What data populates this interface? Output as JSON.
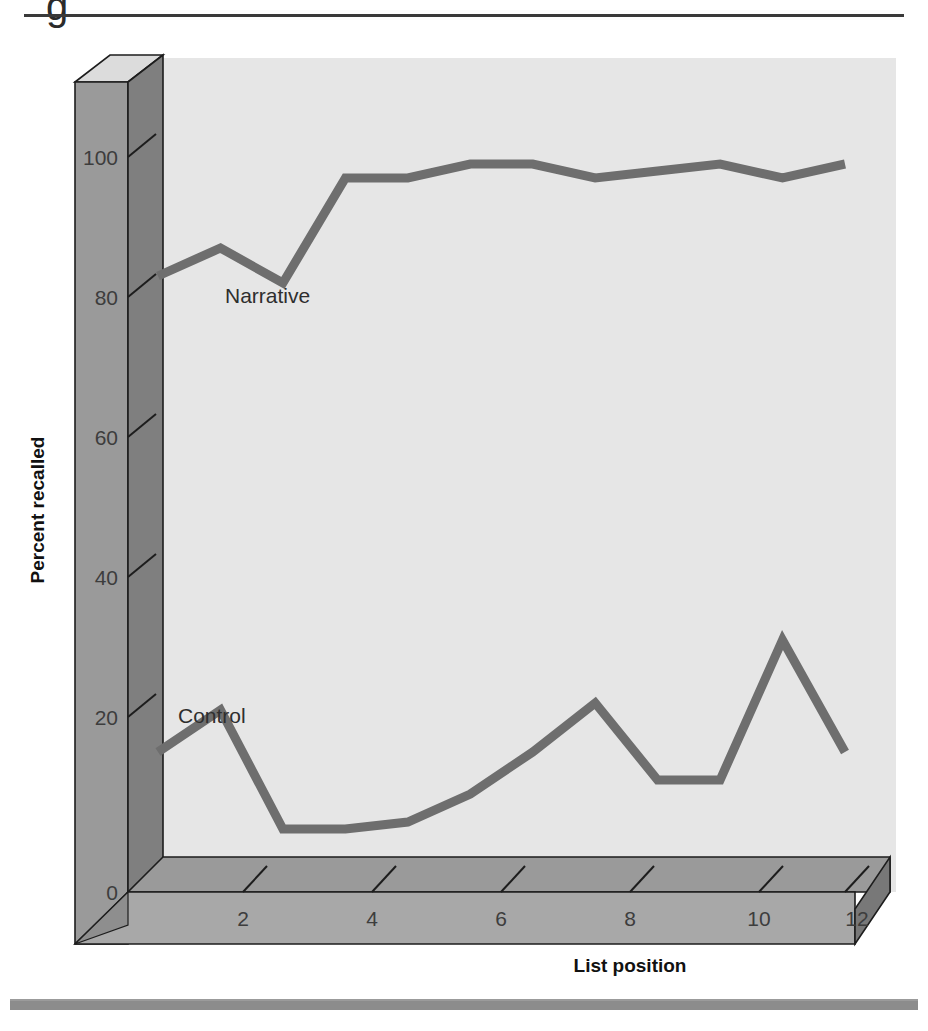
{
  "page": {
    "top_cropped_text": "g",
    "background_color": "#ffffff",
    "rule_color": "#8c8c8c"
  },
  "figure": {
    "plot_background_color": "#e6e6e6",
    "axis_block_face_color": "#8f8f8f",
    "axis_block_top_color": "#d8d8d8",
    "axis_block_side_color": "#7a7a7a",
    "line_color": "#6e6e6e",
    "line_width": 9
  },
  "chart_data": {
    "type": "line",
    "title": "",
    "xlabel": "List position",
    "ylabel": "Percent recalled",
    "x": [
      1,
      2,
      3,
      4,
      5,
      6,
      7,
      8,
      9,
      10,
      11,
      12
    ],
    "xlim": [
      0.5,
      12.5
    ],
    "ylim": [
      0,
      108
    ],
    "xticks": [
      2,
      4,
      6,
      8,
      10,
      12
    ],
    "xticklabels": [
      "2",
      "4",
      "6",
      "8",
      "10",
      "12"
    ],
    "yticks": [
      0,
      20,
      40,
      60,
      80,
      100
    ],
    "yticklabels": [
      "0",
      "20",
      "40",
      "60",
      "80",
      "100"
    ],
    "grid": false,
    "legend_position": "inline-annotations",
    "series": [
      {
        "name": "Narrative",
        "label": "Narrative",
        "color": "#6e6e6e",
        "values": [
          83,
          87,
          82,
          97,
          97,
          99,
          99,
          97,
          98,
          99,
          97,
          99
        ],
        "annotation": {
          "text": "Narrative",
          "x": 2.45,
          "y": 76
        }
      },
      {
        "name": "Control",
        "label": "Control",
        "color": "#6e6e6e",
        "values": [
          15,
          21,
          4,
          4,
          5,
          9,
          15,
          22,
          11,
          11,
          31,
          15
        ],
        "annotation": {
          "text": "Control",
          "x": 1.55,
          "y": 26
        }
      }
    ]
  }
}
